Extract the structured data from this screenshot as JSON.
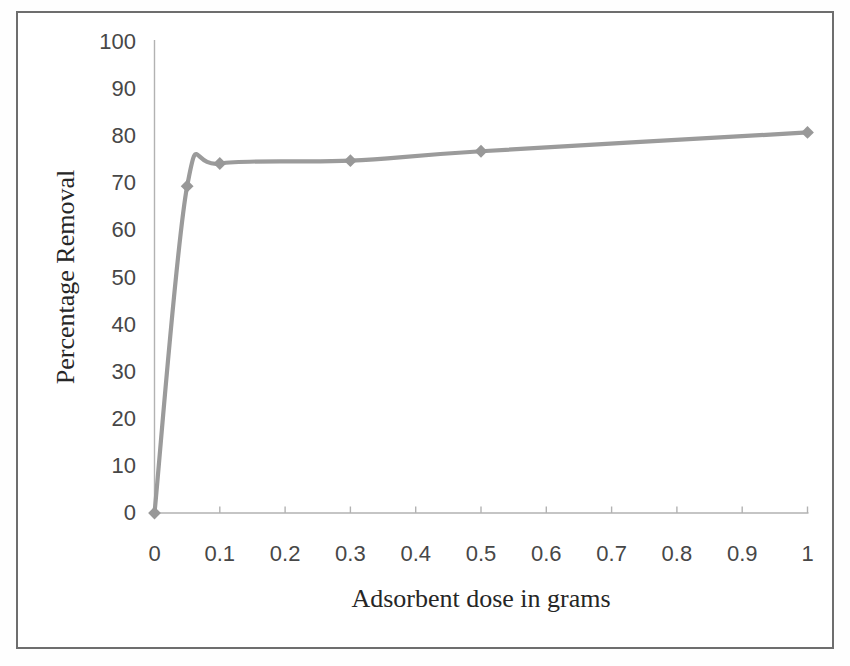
{
  "chart_data": {
    "type": "line",
    "x": [
      0,
      0.05,
      0.1,
      0.3,
      0.5,
      1
    ],
    "y": [
      0,
      69.4,
      74.2,
      74.8,
      76.8,
      80.8
    ],
    "title": "",
    "xlabel": "Adsorbent dose in grams",
    "ylabel": "Percentage Removal",
    "xlim": [
      0,
      1
    ],
    "ylim": [
      0,
      100
    ],
    "xticks": {
      "values": [
        0,
        0.1,
        0.2,
        0.3,
        0.4,
        0.5,
        0.6,
        0.7,
        0.8,
        0.9,
        1
      ],
      "labels": [
        "0",
        "0.1",
        "0.2",
        "0.3",
        "0.4",
        "0.5",
        "0.6",
        "0.7",
        "0.8",
        "0.9",
        "1"
      ]
    },
    "yticks": {
      "values": [
        0,
        10,
        20,
        30,
        40,
        50,
        60,
        70,
        80,
        90,
        100
      ],
      "labels": [
        "0",
        "10",
        "20",
        "30",
        "40",
        "50",
        "60",
        "70",
        "80",
        "90",
        "100"
      ]
    },
    "grid": false,
    "legend": false,
    "smooth": true,
    "marker": "diamond",
    "line_color": "#9b9b9b",
    "marker_color": "#989898",
    "axis_color": "#b2b2b2",
    "tick_label_color": "#474747",
    "axis_title_color": "#262626",
    "frame_color": "#6e6e6e"
  }
}
